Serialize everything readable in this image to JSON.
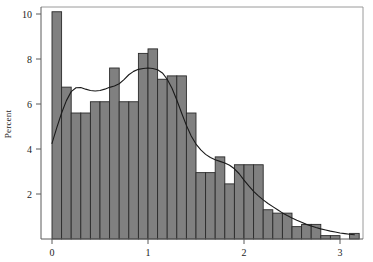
{
  "chart_data": {
    "type": "bar",
    "title": "",
    "subtitle": "",
    "xlabel": "",
    "ylabel": "Percent",
    "xlim": [
      -0.12,
      3.35
    ],
    "ylim": [
      0,
      10.4
    ],
    "grid": false,
    "legend": null,
    "bin_width": 0.1,
    "x_ticks": [
      0,
      1,
      2,
      3
    ],
    "x_tick_labels": [
      "0",
      "1",
      "2",
      "3"
    ],
    "y_ticks": [
      2,
      4,
      6,
      8,
      10
    ],
    "y_tick_labels": [
      "2",
      "4",
      "6",
      "8",
      "10"
    ],
    "bar_color": "#808080",
    "bar_edge_color": "#2a2a2a",
    "curve_color": "#1a1a1a",
    "frame_color": "#9a9a9a",
    "categories": [
      "0.0",
      "0.1",
      "0.2",
      "0.3",
      "0.4",
      "0.5",
      "0.6",
      "0.7",
      "0.8",
      "0.9",
      "1.0",
      "1.1",
      "1.2",
      "1.3",
      "1.4",
      "1.5",
      "1.6",
      "1.7",
      "1.8",
      "1.9",
      "2.0",
      "2.1",
      "2.2",
      "2.3",
      "2.4",
      "2.5",
      "2.6",
      "2.7",
      "2.8",
      "2.9",
      "3.0",
      "3.1"
    ],
    "bin_left_edges": [
      0.0,
      0.1,
      0.2,
      0.3,
      0.4,
      0.5,
      0.6,
      0.7,
      0.8,
      0.9,
      1.0,
      1.1,
      1.2,
      1.3,
      1.4,
      1.5,
      1.6,
      1.7,
      1.8,
      1.9,
      2.0,
      2.1,
      2.2,
      2.3,
      2.4,
      2.5,
      2.6,
      2.7,
      2.8,
      2.9,
      3.0,
      3.1
    ],
    "values": [
      10.1,
      6.75,
      5.6,
      5.6,
      6.1,
      6.1,
      7.6,
      6.1,
      6.1,
      8.25,
      8.45,
      7.1,
      7.25,
      7.25,
      5.6,
      2.95,
      2.95,
      3.65,
      2.45,
      3.3,
      3.3,
      3.3,
      1.3,
      1.15,
      1.15,
      0.55,
      0.65,
      0.65,
      0.15,
      0.15,
      0.0,
      0.25
    ],
    "series": [
      {
        "name": "Percent",
        "type": "bar",
        "values": [
          10.1,
          6.75,
          5.6,
          5.6,
          6.1,
          6.1,
          7.6,
          6.1,
          6.1,
          8.25,
          8.45,
          7.1,
          7.25,
          7.25,
          5.6,
          2.95,
          2.95,
          3.65,
          2.45,
          3.3,
          3.3,
          3.3,
          1.3,
          1.15,
          1.15,
          0.55,
          0.65,
          0.65,
          0.15,
          0.15,
          0.0,
          0.25
        ]
      },
      {
        "name": "Kernel density",
        "type": "line",
        "x": [
          0.0,
          0.05,
          0.1,
          0.15,
          0.2,
          0.25,
          0.3,
          0.35,
          0.4,
          0.45,
          0.5,
          0.55,
          0.6,
          0.65,
          0.7,
          0.75,
          0.8,
          0.85,
          0.9,
          0.95,
          1.0,
          1.05,
          1.1,
          1.15,
          1.2,
          1.25,
          1.3,
          1.35,
          1.4,
          1.45,
          1.5,
          1.55,
          1.6,
          1.65,
          1.7,
          1.75,
          1.8,
          1.85,
          1.9,
          1.95,
          2.0,
          2.05,
          2.1,
          2.15,
          2.2,
          2.25,
          2.3,
          2.35,
          2.4,
          2.45,
          2.5,
          2.55,
          2.6,
          2.65,
          2.7,
          2.75,
          2.8,
          2.85,
          2.9,
          2.95,
          3.0,
          3.05,
          3.1,
          3.15
        ],
        "values": [
          4.25,
          4.95,
          5.6,
          6.15,
          6.55,
          6.72,
          6.73,
          6.66,
          6.6,
          6.58,
          6.6,
          6.66,
          6.74,
          6.8,
          6.9,
          7.08,
          7.3,
          7.45,
          7.54,
          7.58,
          7.6,
          7.58,
          7.52,
          7.38,
          7.1,
          6.7,
          6.18,
          5.6,
          5.05,
          4.58,
          4.22,
          3.96,
          3.76,
          3.62,
          3.52,
          3.45,
          3.38,
          3.28,
          3.12,
          2.9,
          2.62,
          2.36,
          2.12,
          1.92,
          1.74,
          1.58,
          1.44,
          1.3,
          1.16,
          1.04,
          0.93,
          0.83,
          0.74,
          0.65,
          0.58,
          0.51,
          0.45,
          0.4,
          0.35,
          0.31,
          0.27,
          0.24,
          0.21,
          0.19
        ]
      }
    ]
  },
  "axes": {
    "y_axis_title": "Percent"
  }
}
